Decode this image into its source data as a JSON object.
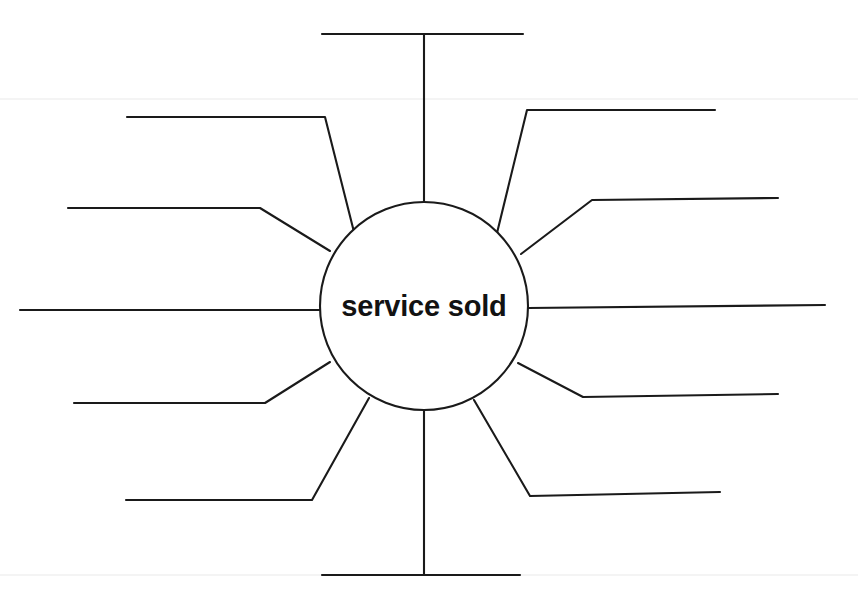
{
  "page": {
    "width": 858,
    "height": 593,
    "background_color": "#ffffff",
    "ink_color": "#1a1a1a"
  },
  "diagram": {
    "type": "spider-web-brainstorm-template",
    "hub": {
      "label": "service sold",
      "cx": 424,
      "cy": 306,
      "r": 104,
      "fill": "#ffffff",
      "stroke": "#1a1a1a"
    },
    "spokes": [
      {
        "id": "spoke-top",
        "name": "spoke-top",
        "label": "",
        "path": "M 424 202 L 424 34 M 322 34 L 523 34"
      },
      {
        "id": "spoke-upper-right",
        "name": "spoke-upper-right",
        "label": "",
        "path": "M 497 233 L 527 110 L 715 110"
      },
      {
        "id": "spoke-right-upper-mid",
        "name": "spoke-right-upper-mid",
        "label": "",
        "path": "M 521 254 L 592 200 L 778 198"
      },
      {
        "id": "spoke-right",
        "name": "spoke-right",
        "label": "",
        "path": "M 528 308 L 825 305"
      },
      {
        "id": "spoke-right-lower-mid",
        "name": "spoke-right-lower-mid",
        "label": "",
        "path": "M 518 363 L 583 397 L 778 394"
      },
      {
        "id": "spoke-lower-right",
        "name": "spoke-lower-right",
        "label": "",
        "path": "M 474 400 L 530 496 L 720 492"
      },
      {
        "id": "spoke-bottom",
        "name": "spoke-bottom",
        "label": "",
        "path": "M 424 410 L 424 575 M 322 575 L 520 575"
      },
      {
        "id": "spoke-lower-left",
        "name": "spoke-lower-left",
        "label": "",
        "path": "M 369 398 L 312 500 L 126 500"
      },
      {
        "id": "spoke-left-lower-mid",
        "name": "spoke-left-lower-mid",
        "label": "",
        "path": "M 330 362 L 265 403 L 74 403"
      },
      {
        "id": "spoke-left",
        "name": "spoke-left",
        "label": "",
        "path": "M 320 310 L 20 310"
      },
      {
        "id": "spoke-left-upper-mid",
        "name": "spoke-left-upper-mid",
        "label": "",
        "path": "M 330 251 L 260 208 L 68 208"
      },
      {
        "id": "spoke-upper-left",
        "name": "spoke-upper-left",
        "label": "",
        "path": "M 354 232 L 325 117 L 127 117"
      }
    ],
    "scan_artifacts": [
      {
        "id": "scan-band-top",
        "y": 98
      },
      {
        "id": "scan-band-mid",
        "y": 574
      }
    ]
  }
}
